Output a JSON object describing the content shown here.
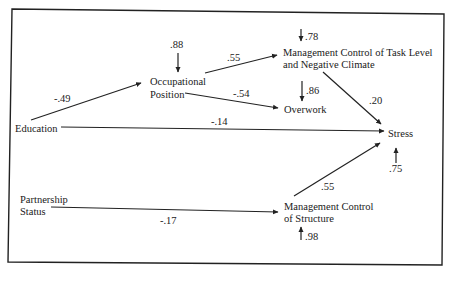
{
  "diagram": {
    "type": "path-diagram",
    "nodes": {
      "education": {
        "label": "Education"
      },
      "occupational_position": {
        "line1": "Occupational",
        "line2": "Position"
      },
      "mgmt_task": {
        "line1": "Management Control of Task Level",
        "line2": "and Negative Climate"
      },
      "overwork": {
        "label": "Overwork"
      },
      "stress": {
        "label": "Stress"
      },
      "partnership_status": {
        "line1": "Partnership",
        "line2": "Status"
      },
      "mgmt_structure": {
        "line1": "Management Control",
        "line2": "of Structure"
      }
    },
    "edges": [
      {
        "from": "Education",
        "to": "Occupational Position",
        "coef": "-.49"
      },
      {
        "from": "Occupational Position",
        "to": "Management Control of Task Level and Negative Climate",
        "coef": ".55"
      },
      {
        "from": "Occupational Position",
        "to": "Overwork",
        "coef": "-.54"
      },
      {
        "from": "Education",
        "to": "Stress",
        "coef": "-.14"
      },
      {
        "from": "Management Control of Task Level and Negative Climate",
        "to": "Stress",
        "coef": ".20"
      },
      {
        "from": "Partnership Status",
        "to": "Management Control of Structure",
        "coef": "-.17"
      },
      {
        "from": "Management Control of Structure",
        "to": "Stress",
        "coef": ".55"
      }
    ],
    "residuals": {
      "occupational_position": ".88",
      "mgmt_task": ".78",
      "overwork": ".86",
      "stress": ".75",
      "mgmt_structure": ".98"
    }
  }
}
